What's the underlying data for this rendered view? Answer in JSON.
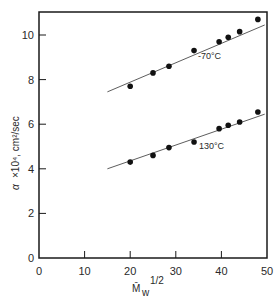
{
  "chart_data": {
    "type": "scatter",
    "title": "",
    "xlabel": "M̄w^1/2",
    "ylabel": "α ×10⁴, cm²/sec",
    "xlim": [
      0,
      50
    ],
    "ylim": [
      0,
      11
    ],
    "xticks": [
      0,
      10,
      20,
      30,
      40,
      50
    ],
    "yticks": [
      0,
      2,
      4,
      6,
      8,
      10
    ],
    "grid": false,
    "legend": "inline labels",
    "series": [
      {
        "name": "-70°C",
        "x": [
          20,
          25,
          28.5,
          34,
          39.5,
          41.5,
          44,
          48
        ],
        "y": [
          7.7,
          8.3,
          8.6,
          9.3,
          9.7,
          9.9,
          10.15,
          10.7
        ],
        "fit_line": {
          "x": [
            15,
            49.5
          ],
          "y": [
            7.45,
            10.45
          ]
        }
      },
      {
        "name": "130°C",
        "x": [
          20,
          25,
          28.5,
          34,
          39.5,
          41.5,
          44,
          48
        ],
        "y": [
          4.3,
          4.6,
          4.95,
          5.2,
          5.8,
          5.95,
          6.1,
          6.55
        ],
        "fit_line": {
          "x": [
            15,
            49.5
          ],
          "y": [
            4.0,
            6.45
          ]
        }
      }
    ]
  },
  "labels": {
    "series_top": "-70°C",
    "series_bottom": "130°C",
    "y_axis_alpha": "α",
    "y_axis_rest": "×10⁴, cm²/sec",
    "x_axis_main": "M̄",
    "x_axis_sub": "w",
    "x_axis_sup": "1/2"
  }
}
